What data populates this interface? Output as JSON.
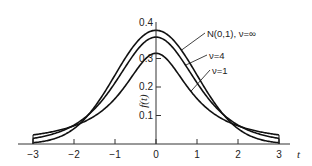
{
  "chart_data": {
    "type": "line",
    "title": "",
    "xlabel": "t",
    "ylabel": "f(t)",
    "xlim": [
      -3,
      3
    ],
    "ylim": [
      0,
      0.4
    ],
    "grid": false,
    "x_ticks": [
      -3,
      -2,
      -1,
      0,
      1,
      2,
      3
    ],
    "x_tick_labels": [
      "−3",
      "−2",
      "−1",
      "0",
      "1",
      "2",
      "3"
    ],
    "y_ticks": [
      0.1,
      0.2,
      0.3,
      0.4
    ],
    "y_tick_labels": [
      "0.1",
      "0.2",
      "0.3",
      "0.4"
    ],
    "legend_position": "inline labels with leader lines, upper right of peak",
    "series": [
      {
        "name": "N(0,1), ν = ∞",
        "label": "N(0,1), ν=∞",
        "distribution": "normal",
        "nu": null,
        "peak": 0.399,
        "x": [
          -3,
          -2,
          -1,
          0,
          1,
          2,
          3
        ],
        "values": [
          0.0044,
          0.054,
          0.242,
          0.399,
          0.242,
          0.054,
          0.0044
        ]
      },
      {
        "name": "ν = 4",
        "label": "ν=4",
        "distribution": "student-t",
        "nu": 4,
        "peak": 0.375,
        "x": [
          -3,
          -2,
          -1,
          0,
          1,
          2,
          3
        ],
        "values": [
          0.0197,
          0.066,
          0.215,
          0.375,
          0.215,
          0.066,
          0.0197
        ]
      },
      {
        "name": "ν = 1",
        "label": "ν=1",
        "distribution": "student-t",
        "nu": 1,
        "peak": 0.318,
        "x": [
          -3,
          -2,
          -1,
          0,
          1,
          2,
          3
        ],
        "values": [
          0.0318,
          0.0637,
          0.159,
          0.318,
          0.159,
          0.0637,
          0.0318
        ]
      }
    ],
    "annotations": [
      {
        "text": "N(0,1), ν=∞",
        "series": 0
      },
      {
        "text": "ν=4",
        "series": 1
      },
      {
        "text": "ν=1",
        "series": 2
      }
    ]
  },
  "layout": {
    "line_color": "#111111",
    "axis_color": "#333333"
  }
}
